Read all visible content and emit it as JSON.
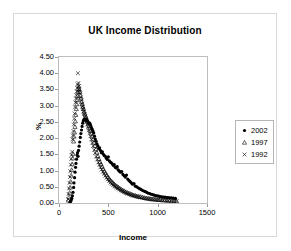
{
  "chart_data": {
    "type": "scatter",
    "title": "UK Income Distribution",
    "xlabel": "Income",
    "ylabel": "%",
    "xlim": [
      0,
      1500
    ],
    "ylim": [
      0,
      4.5
    ],
    "grid": false,
    "legend_position": "right",
    "xticks": [
      "0",
      "500",
      "1000",
      "1500"
    ],
    "xtick_values": [
      0,
      500,
      1000,
      1500
    ],
    "yticks": [
      "0.00",
      "0.50",
      "1.00",
      "1.50",
      "2.00",
      "2.50",
      "3.00",
      "3.50",
      "4.00",
      "4.50"
    ],
    "ytick_values": [
      0,
      0.5,
      1.0,
      1.5,
      2.0,
      2.5,
      3.0,
      3.5,
      4.0,
      4.5
    ],
    "series": [
      {
        "name": "2002",
        "marker": "filled-circle",
        "color": "#000000",
        "points": [
          [
            110,
            0.03
          ],
          [
            118,
            0.05
          ],
          [
            124,
            0.09
          ],
          [
            130,
            0.14
          ],
          [
            136,
            0.22
          ],
          [
            142,
            0.33
          ],
          [
            148,
            0.48
          ],
          [
            152,
            0.62
          ],
          [
            158,
            0.78
          ],
          [
            163,
            0.95
          ],
          [
            168,
            1.1
          ],
          [
            172,
            1.22
          ],
          [
            178,
            1.35
          ],
          [
            183,
            1.48
          ],
          [
            188,
            1.55
          ],
          [
            193,
            1.44
          ],
          [
            198,
            1.62
          ],
          [
            204,
            1.75
          ],
          [
            210,
            1.88
          ],
          [
            216,
            2.02
          ],
          [
            222,
            2.14
          ],
          [
            228,
            2.25
          ],
          [
            234,
            2.36
          ],
          [
            240,
            2.46
          ],
          [
            246,
            2.53
          ],
          [
            252,
            2.56
          ],
          [
            258,
            2.58
          ],
          [
            264,
            2.57
          ],
          [
            270,
            2.55
          ],
          [
            276,
            2.58
          ],
          [
            283,
            2.55
          ],
          [
            290,
            2.52
          ],
          [
            297,
            2.48
          ],
          [
            305,
            2.45
          ],
          [
            312,
            2.46
          ],
          [
            320,
            2.4
          ],
          [
            328,
            2.33
          ],
          [
            336,
            2.28
          ],
          [
            344,
            2.22
          ],
          [
            352,
            2.16
          ],
          [
            360,
            2.06
          ],
          [
            368,
            1.97
          ],
          [
            376,
            1.9
          ],
          [
            385,
            1.82
          ],
          [
            394,
            1.76
          ],
          [
            402,
            1.68
          ],
          [
            411,
            1.7
          ],
          [
            420,
            1.62
          ],
          [
            430,
            1.55
          ],
          [
            440,
            1.58
          ],
          [
            450,
            1.5
          ],
          [
            460,
            1.46
          ],
          [
            470,
            1.44
          ],
          [
            480,
            1.38
          ],
          [
            490,
            1.34
          ],
          [
            500,
            1.42
          ],
          [
            510,
            1.3
          ],
          [
            520,
            1.26
          ],
          [
            530,
            1.24
          ],
          [
            540,
            1.21
          ],
          [
            550,
            1.16
          ],
          [
            560,
            1.18
          ],
          [
            570,
            1.1
          ],
          [
            580,
            1.08
          ],
          [
            590,
            1.12
          ],
          [
            600,
            1.02
          ],
          [
            612,
            0.98
          ],
          [
            624,
            0.95
          ],
          [
            636,
            0.97
          ],
          [
            648,
            0.88
          ],
          [
            660,
            0.84
          ],
          [
            672,
            0.8
          ],
          [
            684,
            0.86
          ],
          [
            696,
            0.74
          ],
          [
            708,
            0.7
          ],
          [
            720,
            0.66
          ],
          [
            733,
            0.62
          ],
          [
            746,
            0.58
          ],
          [
            760,
            0.6
          ],
          [
            774,
            0.52
          ],
          [
            788,
            0.5
          ],
          [
            802,
            0.47
          ],
          [
            816,
            0.44
          ],
          [
            830,
            0.42
          ],
          [
            845,
            0.39
          ],
          [
            860,
            0.37
          ],
          [
            875,
            0.35
          ],
          [
            890,
            0.33
          ],
          [
            905,
            0.3
          ],
          [
            920,
            0.29
          ],
          [
            935,
            0.27
          ],
          [
            950,
            0.26
          ],
          [
            965,
            0.24
          ],
          [
            980,
            0.23
          ],
          [
            995,
            0.22
          ],
          [
            1010,
            0.21
          ],
          [
            1026,
            0.2
          ],
          [
            1042,
            0.19
          ],
          [
            1058,
            0.18
          ],
          [
            1074,
            0.18
          ],
          [
            1090,
            0.17
          ],
          [
            1106,
            0.17
          ],
          [
            1122,
            0.16
          ],
          [
            1140,
            0.16
          ],
          [
            1160,
            0.15
          ],
          [
            1180,
            0.14
          ]
        ]
      },
      {
        "name": "1997",
        "marker": "triangle",
        "color": "#000000",
        "points": [
          [
            96,
            0.08
          ],
          [
            102,
            0.18
          ],
          [
            108,
            0.32
          ],
          [
            113,
            0.48
          ],
          [
            118,
            0.66
          ],
          [
            123,
            0.85
          ],
          [
            128,
            1.02
          ],
          [
            133,
            1.2
          ],
          [
            138,
            1.38
          ],
          [
            142,
            1.52
          ],
          [
            148,
            1.9
          ],
          [
            152,
            2.05
          ],
          [
            157,
            2.18
          ],
          [
            162,
            2.35
          ],
          [
            166,
            2.52
          ],
          [
            170,
            2.72
          ],
          [
            175,
            2.9
          ],
          [
            180,
            3.05
          ],
          [
            184,
            3.18
          ],
          [
            188,
            3.3
          ],
          [
            192,
            3.42
          ],
          [
            196,
            3.52
          ],
          [
            200,
            3.6
          ],
          [
            206,
            3.5
          ],
          [
            212,
            3.42
          ],
          [
            218,
            3.3
          ],
          [
            224,
            3.22
          ],
          [
            230,
            3.12
          ],
          [
            236,
            3.04
          ],
          [
            242,
            2.96
          ],
          [
            248,
            2.9
          ],
          [
            254,
            2.82
          ],
          [
            260,
            2.76
          ],
          [
            267,
            2.7
          ],
          [
            274,
            2.64
          ],
          [
            281,
            2.58
          ],
          [
            288,
            2.52
          ],
          [
            296,
            2.45
          ],
          [
            304,
            2.38
          ],
          [
            312,
            2.3
          ],
          [
            320,
            2.22
          ],
          [
            328,
            2.14
          ],
          [
            337,
            2.05
          ],
          [
            346,
            1.96
          ],
          [
            355,
            1.86
          ],
          [
            364,
            1.76
          ],
          [
            374,
            1.66
          ],
          [
            384,
            1.56
          ],
          [
            394,
            1.45
          ],
          [
            404,
            1.36
          ],
          [
            415,
            1.27
          ],
          [
            426,
            1.2
          ],
          [
            437,
            1.12
          ],
          [
            448,
            1.05
          ],
          [
            460,
            0.98
          ],
          [
            472,
            0.92
          ],
          [
            484,
            0.86
          ],
          [
            496,
            0.8
          ],
          [
            508,
            0.75
          ],
          [
            521,
            0.7
          ],
          [
            534,
            0.66
          ],
          [
            547,
            0.62
          ],
          [
            560,
            0.58
          ],
          [
            574,
            0.54
          ],
          [
            588,
            0.51
          ],
          [
            602,
            0.48
          ],
          [
            616,
            0.45
          ],
          [
            631,
            0.42
          ],
          [
            646,
            0.39
          ],
          [
            661,
            0.37
          ],
          [
            676,
            0.34
          ],
          [
            692,
            0.32
          ],
          [
            708,
            0.3
          ],
          [
            724,
            0.28
          ],
          [
            740,
            0.26
          ],
          [
            757,
            0.24
          ],
          [
            774,
            0.23
          ],
          [
            791,
            0.21
          ],
          [
            809,
            0.2
          ],
          [
            827,
            0.19
          ],
          [
            845,
            0.18
          ],
          [
            864,
            0.16
          ],
          [
            883,
            0.15
          ],
          [
            902,
            0.14
          ],
          [
            922,
            0.13
          ],
          [
            942,
            0.12
          ],
          [
            962,
            0.12
          ],
          [
            983,
            0.11
          ],
          [
            1004,
            0.1
          ],
          [
            1026,
            0.1
          ],
          [
            1048,
            0.09
          ],
          [
            1070,
            0.09
          ],
          [
            1093,
            0.08
          ],
          [
            1116,
            0.08
          ],
          [
            1140,
            0.07
          ],
          [
            1165,
            0.07
          ],
          [
            1190,
            0.06
          ]
        ]
      },
      {
        "name": "1992",
        "marker": "cross",
        "color": "#000000",
        "points": [
          [
            92,
            0.12
          ],
          [
            97,
            0.28
          ],
          [
            102,
            0.45
          ],
          [
            107,
            0.62
          ],
          [
            111,
            0.8
          ],
          [
            115,
            0.98
          ],
          [
            120,
            1.18
          ],
          [
            124,
            1.36
          ],
          [
            128,
            1.48
          ],
          [
            133,
            1.58
          ],
          [
            137,
            1.96
          ],
          [
            141,
            2.08
          ],
          [
            146,
            2.22
          ],
          [
            150,
            2.42
          ],
          [
            154,
            2.6
          ],
          [
            158,
            2.76
          ],
          [
            163,
            2.95
          ],
          [
            167,
            3.1
          ],
          [
            172,
            3.22
          ],
          [
            176,
            3.32
          ],
          [
            180,
            3.44
          ],
          [
            184,
            3.55
          ],
          [
            188,
            3.66
          ],
          [
            192,
            4.0
          ],
          [
            197,
            3.7
          ],
          [
            202,
            3.6
          ],
          [
            208,
            3.48
          ],
          [
            214,
            3.38
          ],
          [
            220,
            3.26
          ],
          [
            226,
            3.16
          ],
          [
            232,
            3.06
          ],
          [
            238,
            2.98
          ],
          [
            244,
            2.9
          ],
          [
            250,
            2.82
          ],
          [
            257,
            2.74
          ],
          [
            264,
            2.66
          ],
          [
            271,
            2.58
          ],
          [
            278,
            2.5
          ],
          [
            286,
            2.42
          ],
          [
            294,
            2.33
          ],
          [
            302,
            2.24
          ],
          [
            310,
            2.16
          ],
          [
            319,
            2.06
          ],
          [
            328,
            1.96
          ],
          [
            337,
            1.86
          ],
          [
            346,
            1.76
          ],
          [
            356,
            1.64
          ],
          [
            366,
            1.54
          ],
          [
            376,
            1.43
          ],
          [
            387,
            1.34
          ],
          [
            398,
            1.25
          ],
          [
            409,
            1.17
          ],
          [
            420,
            1.1
          ],
          [
            432,
            1.03
          ],
          [
            444,
            0.96
          ],
          [
            456,
            0.9
          ],
          [
            469,
            0.84
          ],
          [
            482,
            0.78
          ],
          [
            495,
            0.73
          ],
          [
            508,
            0.68
          ],
          [
            522,
            0.63
          ],
          [
            536,
            0.59
          ],
          [
            550,
            0.55
          ],
          [
            565,
            0.51
          ],
          [
            580,
            0.48
          ],
          [
            595,
            0.45
          ],
          [
            611,
            0.42
          ],
          [
            627,
            0.39
          ],
          [
            643,
            0.36
          ],
          [
            660,
            0.34
          ],
          [
            677,
            0.31
          ],
          [
            694,
            0.29
          ],
          [
            712,
            0.27
          ],
          [
            730,
            0.25
          ],
          [
            749,
            0.23
          ],
          [
            768,
            0.22
          ],
          [
            787,
            0.2
          ],
          [
            807,
            0.19
          ],
          [
            827,
            0.17
          ],
          [
            848,
            0.16
          ],
          [
            869,
            0.15
          ],
          [
            891,
            0.14
          ],
          [
            913,
            0.13
          ],
          [
            936,
            0.12
          ],
          [
            959,
            0.11
          ],
          [
            983,
            0.1
          ],
          [
            1007,
            0.1
          ],
          [
            1032,
            0.09
          ],
          [
            1057,
            0.08
          ],
          [
            1083,
            0.08
          ],
          [
            1109,
            0.07
          ],
          [
            1136,
            0.07
          ],
          [
            1164,
            0.06
          ],
          [
            1192,
            0.06
          ]
        ]
      }
    ]
  },
  "legend": {
    "items": [
      {
        "label": "2002",
        "marker": "filled-circle"
      },
      {
        "label": "1997",
        "marker": "triangle"
      },
      {
        "label": "1992",
        "marker": "cross"
      }
    ]
  }
}
